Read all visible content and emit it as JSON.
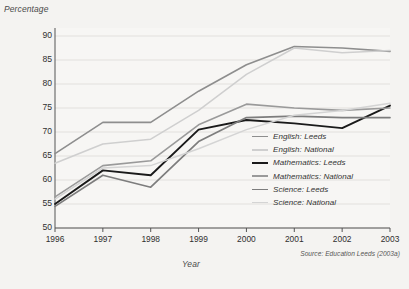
{
  "chart_data": {
    "type": "line",
    "title": "",
    "ylabel": "Percentage",
    "xlabel": "Year",
    "source": "Source: Education Leeds (2003a)",
    "x": [
      1996,
      1997,
      1998,
      1999,
      2000,
      2001,
      2002,
      2003
    ],
    "categories": [
      "1996",
      "1997",
      "1998",
      "1999",
      "2000",
      "2001",
      "2002",
      "2003"
    ],
    "ylim": [
      50,
      90
    ],
    "yticks": [
      50,
      55,
      60,
      65,
      70,
      75,
      80,
      85,
      90
    ],
    "ytick_labels": [
      "50",
      "55",
      "60",
      "65",
      "70",
      "75",
      "80",
      "85",
      "90"
    ],
    "grid": true,
    "legend_position": "right-inside",
    "series": [
      {
        "name": "English: Leeds",
        "color": "#8e8e8e",
        "width": 1.6,
        "values": [
          65.5,
          72.0,
          72.0,
          78.5,
          84.0,
          87.8,
          87.5,
          86.8
        ]
      },
      {
        "name": "English: National",
        "color": "#cfcfcf",
        "width": 1.5,
        "values": [
          63.5,
          67.5,
          68.5,
          74.5,
          82.0,
          87.5,
          86.5,
          87.0
        ]
      },
      {
        "name": "Mathematics: Leeds",
        "color": "#1a1a1a",
        "width": 1.9,
        "values": [
          55.0,
          62.0,
          61.0,
          70.5,
          72.5,
          71.8,
          70.8,
          75.5
        ]
      },
      {
        "name": "Mathematics: National",
        "color": "#9a9a9a",
        "width": 1.6,
        "values": [
          56.5,
          63.0,
          64.0,
          71.5,
          75.8,
          75.0,
          74.5,
          75.0
        ]
      },
      {
        "name": "Science: Leeds",
        "color": "#7d7d7d",
        "width": 1.7,
        "values": [
          54.5,
          61.0,
          58.5,
          68.0,
          73.0,
          73.3,
          73.0,
          73.0
        ]
      },
      {
        "name": "Science: National",
        "color": "#d4d4d4",
        "width": 1.5,
        "values": [
          56.0,
          62.5,
          63.0,
          66.5,
          70.5,
          73.5,
          74.5,
          76.0
        ]
      }
    ]
  }
}
